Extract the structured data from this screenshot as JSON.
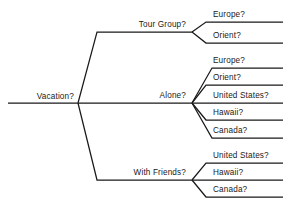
{
  "diagram": {
    "type": "decision-tree",
    "line_color": "#1a1a1a",
    "background_color": "#ffffff",
    "root": {
      "label": "Vacation?"
    },
    "branches": [
      {
        "label": "Tour Group?",
        "leaves": [
          {
            "label": "Europe?"
          },
          {
            "label": "Orient?"
          }
        ]
      },
      {
        "label": "Alone?",
        "leaves": [
          {
            "label": "Europe?"
          },
          {
            "label": "Orient?"
          },
          {
            "label": "United States?"
          },
          {
            "label": "Hawaii?"
          },
          {
            "label": "Canada?"
          }
        ]
      },
      {
        "label": "With Friends?",
        "leaves": [
          {
            "label": "United States?"
          },
          {
            "label": "Hawaii?"
          },
          {
            "label": "Canada?"
          }
        ]
      }
    ]
  }
}
